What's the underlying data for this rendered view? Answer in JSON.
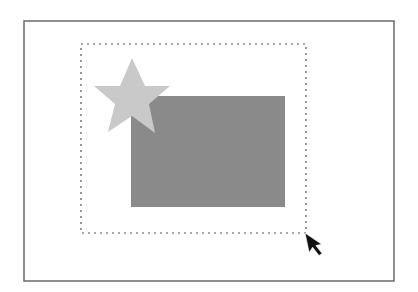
{
  "scene": {
    "description": "Selection marquee drag around a star and a rectangle",
    "background": "#ffffff",
    "frame": {
      "x1": 24,
      "y1": 21,
      "x2": 394,
      "y2": 281,
      "stroke": "#6a6a6a",
      "stroke_width": 1.5
    },
    "selection_marquee": {
      "x": 81,
      "y": 44,
      "width": 225,
      "height": 189,
      "stroke": "#555555",
      "dash": "2 4"
    },
    "rectangle": {
      "x": 131,
      "y": 96,
      "width": 154,
      "height": 111,
      "fill": "#8a8a8a"
    },
    "star": {
      "points": "132,58 145,86 170,86 149,104 155,133 132,116 108,132 115,104 94,86 120,86",
      "fill": "#c9c9c9"
    },
    "cursor": {
      "icon": "arrow-pointer",
      "x": 305,
      "y": 233,
      "fill": "#111111"
    }
  }
}
